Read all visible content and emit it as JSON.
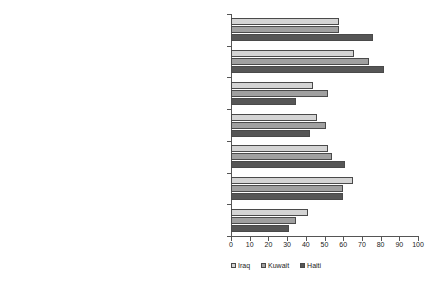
{
  "header": {
    "clipped_text": ""
  },
  "legend": {
    "position": "bottom",
    "entries": [
      {
        "label": "Iraq",
        "color": "#d4d4d4"
      },
      {
        "label": "Kuwait",
        "color": "#a0a0a0"
      },
      {
        "label": "Haiti",
        "color": "#565656"
      }
    ]
  },
  "axis": {
    "ticks": [
      "0",
      "10",
      "20",
      "30",
      "40",
      "50",
      "60",
      "70",
      "80",
      "90",
      "100"
    ]
  },
  "chart_data": {
    "type": "bar",
    "orientation": "horizontal",
    "title": "",
    "xlabel": "",
    "ylabel": "",
    "xlim": [
      0,
      100
    ],
    "xticks": [
      0,
      10,
      20,
      30,
      40,
      50,
      60,
      70,
      80,
      90,
      100
    ],
    "grid": false,
    "legend_position": "bottom",
    "categories": [
      "Combat the flow of illegal drugs in the U.S.",
      "Provide humanitarian relief in the U.S.",
      "Provide humanitarian relief outside the U.S.",
      "Be part of a United Nations peacekeeping force",
      "Maintain a military presence in overseas area of vital\ninterest to the U.S. in order to prevent problems",
      "Provide training to U.S. federal, state,\nand municipal employees",
      "Provide training to foreign federal, state,\nand municipal employees"
    ],
    "series": [
      {
        "name": "Iraq",
        "color": "#d4d4d4",
        "values": [
          58,
          66,
          44,
          46,
          52,
          65,
          41
        ]
      },
      {
        "name": "Kuwait",
        "color": "#a0a0a0",
        "values": [
          58,
          74,
          52,
          51,
          54,
          60,
          35
        ]
      },
      {
        "name": "Haiti",
        "color": "#565656",
        "values": [
          76,
          82,
          35,
          42,
          61,
          60,
          31
        ]
      }
    ]
  }
}
